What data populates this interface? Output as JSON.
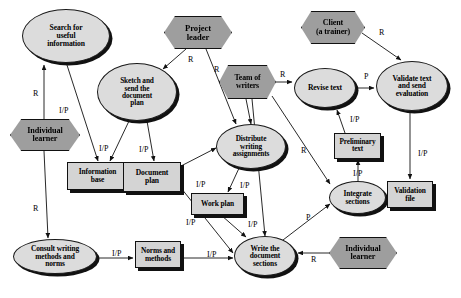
{
  "diagram": {
    "colors": {
      "activity_fill": "#dcdcdc",
      "actor_fill": "#9e9e9e",
      "artifact_fill": "#d4d4d4",
      "stroke": "#111111",
      "background": "#ffffff"
    },
    "nodes": [
      {
        "id": "search_info",
        "label": "Search for\nuseful\ninformation",
        "shape": "ellipse",
        "x": 22,
        "y": 9,
        "w": 88,
        "h": 54,
        "font": 7.6
      },
      {
        "id": "individual_learner_1",
        "label": "Individual\nlearner",
        "shape": "hexagon",
        "x": 10,
        "y": 119,
        "w": 70,
        "h": 32,
        "font": 8.2
      },
      {
        "id": "sketch_plan",
        "label": "Sketch and\nsend the\ndocument\nplan",
        "shape": "ellipse",
        "x": 97,
        "y": 63,
        "w": 80,
        "h": 58,
        "font": 7.3
      },
      {
        "id": "project_leader",
        "label": "Project\nleader",
        "shape": "hexagon",
        "x": 164,
        "y": 16,
        "w": 68,
        "h": 33,
        "font": 8.6
      },
      {
        "id": "team_writers",
        "label": "Team of\nwriters",
        "shape": "hexagon",
        "x": 219,
        "y": 65,
        "w": 57,
        "h": 34,
        "font": 7.8
      },
      {
        "id": "client",
        "label": "Client\n(a trainer)",
        "shape": "hexagon",
        "x": 301,
        "y": 11,
        "w": 64,
        "h": 33,
        "font": 8.0
      },
      {
        "id": "revise_text",
        "label": "Revise text",
        "shape": "ellipse",
        "x": 294,
        "y": 68,
        "w": 62,
        "h": 40,
        "font": 7.6
      },
      {
        "id": "validate_text",
        "label": "Validate text\nand send\nevaluation",
        "shape": "ellipse",
        "x": 376,
        "y": 61,
        "w": 72,
        "h": 50,
        "font": 7.5
      },
      {
        "id": "information_base",
        "label": "Information\nbase",
        "shape": "rect",
        "x": 67,
        "y": 162,
        "w": 61,
        "h": 28,
        "font": 7.4
      },
      {
        "id": "document_plan",
        "label": "Document\nplan",
        "shape": "rect",
        "x": 123,
        "y": 162,
        "w": 58,
        "h": 30,
        "font": 7.6
      },
      {
        "id": "distribute_work",
        "label": "Distribute\nwriting\nassignments",
        "shape": "ellipse",
        "x": 216,
        "y": 124,
        "w": 70,
        "h": 45,
        "font": 7.3
      },
      {
        "id": "preliminary_text",
        "label": "Preliminary\ntext",
        "shape": "rect",
        "x": 334,
        "y": 133,
        "w": 47,
        "h": 26,
        "font": 7.2
      },
      {
        "id": "work_plan",
        "label": "Work plan",
        "shape": "rect",
        "x": 191,
        "y": 193,
        "w": 53,
        "h": 22,
        "font": 7.4
      },
      {
        "id": "integrate_sections",
        "label": "Integrate\nsections",
        "shape": "ellipse",
        "x": 329,
        "y": 181,
        "w": 57,
        "h": 33,
        "font": 7.4
      },
      {
        "id": "validation_file",
        "label": "Validation\nfile",
        "shape": "rect",
        "x": 387,
        "y": 181,
        "w": 46,
        "h": 27,
        "font": 7.4
      },
      {
        "id": "consult_methods",
        "label": "Consult writing\nmethods and\nnorms",
        "shape": "ellipse",
        "x": 13,
        "y": 239,
        "w": 84,
        "h": 35,
        "font": 7.4
      },
      {
        "id": "norms_methods",
        "label": "Norms and\nmethods",
        "shape": "rect",
        "x": 135,
        "y": 241,
        "w": 46,
        "h": 27,
        "font": 7.4
      },
      {
        "id": "write_sections",
        "label": "Write the\ndocument\nsections",
        "shape": "ellipse",
        "x": 234,
        "y": 236,
        "w": 62,
        "h": 40,
        "font": 7.4
      },
      {
        "id": "individual_learner_2",
        "label": "Individual\nlearner",
        "shape": "hexagon",
        "x": 329,
        "y": 237,
        "w": 68,
        "h": 32,
        "font": 8.2
      }
    ],
    "edges": [
      {
        "from": "individual_learner_1",
        "to": "search_info",
        "label": "R",
        "lx": 33,
        "ly": 90,
        "path": "M 44,119 L 44,65",
        "arrow": "up"
      },
      {
        "from": "search_info",
        "to": "information_base",
        "label": "I/P",
        "lx": 59,
        "ly": 107,
        "path": "M 66,62 L 98,161",
        "arrow": "down"
      },
      {
        "from": "individual_learner_1",
        "to": "consult_methods",
        "label": "R",
        "lx": 33,
        "ly": 205,
        "path": "M 44,151 L 48,238",
        "arrow": "down"
      },
      {
        "from": "project_leader",
        "to": "sketch_plan",
        "label": "R",
        "lx": 188,
        "ly": 56,
        "path": "M 186,49 L 163,69",
        "arrow": "down"
      },
      {
        "from": "project_leader",
        "to": "distribute_work",
        "label": "R",
        "lx": 214,
        "ly": 66,
        "path": "M 206,49 L 236,124",
        "arrow": "down"
      },
      {
        "from": "sketch_plan",
        "to": "information_base",
        "label": "I/P",
        "lx": 99,
        "ly": 145,
        "path": "M 129,121 L 110,161",
        "arrow": "up"
      },
      {
        "from": "sketch_plan",
        "to": "document_plan",
        "label": "I/P",
        "lx": 139,
        "ly": 146,
        "path": "M 147,121 L 154,161",
        "arrow": "down"
      },
      {
        "from": "team_writers",
        "to": "revise_text",
        "label": "R",
        "lx": 280,
        "ly": 71,
        "path": "M 276,82 L 292,82",
        "arrow": "right"
      },
      {
        "from": "team_writers",
        "to": "distribute_work",
        "label": "",
        "lx": 0,
        "ly": 0,
        "path": "M 246,99 L 251,124",
        "arrow": "down"
      },
      {
        "from": "team_writers",
        "to": "integrate_sections",
        "label": "R",
        "lx": 301,
        "ly": 147,
        "path": "M 272,96 L 330,184",
        "arrow": "down"
      },
      {
        "from": "team_writers",
        "to": "write_sections",
        "label": "",
        "lx": 0,
        "ly": 0,
        "path": "M 252,99 L 265,236",
        "arrow": "down"
      },
      {
        "from": "client",
        "to": "validate_text",
        "label": "R",
        "lx": 379,
        "ly": 29,
        "path": "M 362,33 L 401,60",
        "arrow": "down"
      },
      {
        "from": "revise_text",
        "to": "validate_text",
        "label": "P",
        "lx": 364,
        "ly": 73,
        "path": "M 357,88 L 374,88",
        "arrow": "right"
      },
      {
        "from": "preliminary_text",
        "to": "revise_text",
        "label": "I/P",
        "lx": 350,
        "ly": 116,
        "path": "M 345,133 L 337,110",
        "arrow": "up"
      },
      {
        "from": "integrate_sections",
        "to": "preliminary_text",
        "label": "I/P",
        "lx": 353,
        "ly": 170,
        "path": "M 358,181 L 358,160",
        "arrow": "up"
      },
      {
        "from": "validate_text",
        "to": "validation_file",
        "label": "I/P",
        "lx": 418,
        "ly": 150,
        "path": "M 410,111 L 410,179",
        "arrow": "down"
      },
      {
        "from": "document_plan",
        "to": "distribute_work",
        "label": "I/P",
        "lx": 196,
        "ly": 181,
        "path": "M 181,166 L 216,148",
        "arrow": "right"
      },
      {
        "from": "distribute_work",
        "to": "work_plan",
        "label": "I/P",
        "lx": 240,
        "ly": 182,
        "path": "M 240,166 L 228,192",
        "arrow": "down"
      },
      {
        "from": "document_plan",
        "to": "write_sections",
        "label": "I/P",
        "lx": 186,
        "ly": 219,
        "path": "M 181,188 L 233,253",
        "arrow": "right"
      },
      {
        "from": "work_plan",
        "to": "write_sections",
        "label": "I/P",
        "lx": 248,
        "ly": 221,
        "path": "M 221,215 L 246,237",
        "arrow": "down"
      },
      {
        "from": "consult_methods",
        "to": "norms_methods",
        "label": "I/P",
        "lx": 112,
        "ly": 250,
        "path": "M 97,258 L 133,258",
        "arrow": "right"
      },
      {
        "from": "norms_methods",
        "to": "write_sections",
        "label": "I/P",
        "lx": 207,
        "ly": 251,
        "path": "M 181,258 L 233,258",
        "arrow": "right"
      },
      {
        "from": "write_sections",
        "to": "integrate_sections",
        "label": "P",
        "lx": 306,
        "ly": 214,
        "path": "M 283,240 L 330,204",
        "arrow": "right"
      },
      {
        "from": "individual_learner_2",
        "to": "write_sections",
        "label": "R",
        "lx": 311,
        "ly": 256,
        "path": "M 329,253 L 298,253",
        "arrow": "left"
      }
    ]
  }
}
